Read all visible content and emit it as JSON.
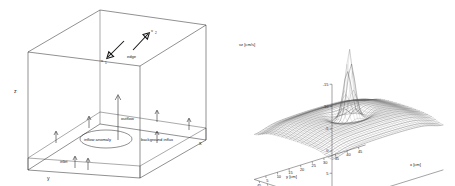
{
  "figure": {
    "panels": [
      "schematic-box",
      "surface-plot"
    ]
  },
  "left_panel": {
    "name": "flow-domain-schematic",
    "axes": {
      "x": "x",
      "y": "y",
      "z": "z"
    },
    "labels": {
      "edge": "edge",
      "inflow_anomaly": "inflow anomaly",
      "background_influx": "background influx",
      "outflow": "outflow",
      "inlet": "inlet",
      "v1": "v",
      "v1_sub": "1",
      "v2": "v",
      "v2_sub": "2"
    }
  },
  "chart_data": {
    "type": "surface",
    "title": "",
    "zlabel": "vz [cm/s]",
    "xlabel": "x [cm]",
    "ylabel": "y [cm]",
    "zticks": [
      -15,
      -10,
      -5,
      0,
      5,
      10
    ],
    "ztick_labels": [
      "-15",
      "-10",
      "-5",
      "0",
      "5",
      "10"
    ],
    "zlim": [
      -15,
      12
    ],
    "xticks": [
      5,
      10,
      15,
      20,
      25,
      30,
      35,
      40,
      45
    ],
    "xtick_labels": [
      "5",
      "10",
      "15",
      "20",
      "25",
      "30",
      "35",
      "40",
      "45"
    ],
    "xlim": [
      0,
      48
    ],
    "yticks": [
      45,
      40,
      35,
      30,
      25,
      20,
      15,
      10,
      5
    ],
    "ytick_labels": [
      "45",
      "40",
      "35",
      "30",
      "25",
      "20",
      "15",
      "10",
      "5"
    ],
    "ylim": [
      0,
      48
    ],
    "y_axis_reversed": true,
    "grid": true,
    "legend": "none",
    "peak": {
      "x": 25,
      "y": 25,
      "vz": -15
    },
    "background_level": -1.5,
    "grid_n": 40
  }
}
